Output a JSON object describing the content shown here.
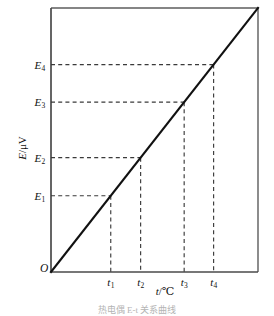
{
  "figure": {
    "origin_label": "O",
    "caption": "热电偶 E-t 关系曲线",
    "x_axis_title_symbol": "t",
    "x_axis_title_unit": "/℃",
    "y_axis_title_symbol": "E",
    "y_axis_title_unit": "/μV"
  },
  "colors": {
    "data_line": "#111111",
    "guide_line": "#3a3a3a",
    "axis": "#4a4a4a",
    "frame": "#5d5d5d",
    "background": "#ffffff",
    "caption": "#b4b4b4"
  },
  "chart_data": {
    "type": "line",
    "title": "",
    "xlabel": "t/℃",
    "ylabel": "E/μV",
    "xlim": [
      0,
      4.85
    ],
    "ylim": [
      0,
      4.85
    ],
    "grid": false,
    "legend": false,
    "series": [
      {
        "name": "E = k·t",
        "x": [
          0,
          4.85
        ],
        "y": [
          0,
          4.85
        ]
      }
    ],
    "points": [
      {
        "index": 1,
        "x": 1.4,
        "y": 1.4,
        "x_label": "t",
        "x_sub": "1",
        "y_label": "E",
        "y_sub": "1"
      },
      {
        "index": 2,
        "x": 2.1,
        "y": 2.1,
        "x_label": "t",
        "x_sub": "2",
        "y_label": "E",
        "y_sub": "2"
      },
      {
        "index": 3,
        "x": 3.12,
        "y": 3.12,
        "x_label": "t",
        "x_sub": "3",
        "y_label": "E",
        "y_sub": "3"
      },
      {
        "index": 4,
        "x": 3.81,
        "y": 3.81,
        "x_label": "t",
        "x_sub": "4",
        "y_label": "E",
        "y_sub": "4"
      }
    ],
    "x_ticks": [
      {
        "value": 1.4,
        "label": "t",
        "sub": "1"
      },
      {
        "value": 2.1,
        "label": "t",
        "sub": "2"
      },
      {
        "value": 3.12,
        "label": "t",
        "sub": "3"
      },
      {
        "value": 3.81,
        "label": "t",
        "sub": "4"
      }
    ],
    "y_ticks": [
      {
        "value": 1.4,
        "label": "E",
        "sub": "1"
      },
      {
        "value": 2.1,
        "label": "E",
        "sub": "2"
      },
      {
        "value": 3.12,
        "label": "E",
        "sub": "3"
      },
      {
        "value": 3.81,
        "label": "E",
        "sub": "4"
      }
    ]
  }
}
